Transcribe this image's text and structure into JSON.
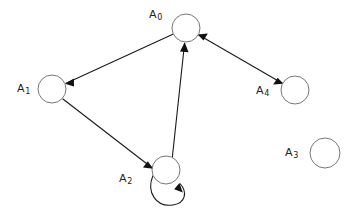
{
  "diagram": {
    "background_color": "#ffffff",
    "node_fill_color": "#ffffff",
    "node_stroke_color": "#777777",
    "edge_color": "#1a1a1a",
    "label_color": "#222222",
    "nodes": [
      {
        "id": "A0",
        "label_main": "A",
        "label_sub": "0",
        "cx": 186,
        "cy": 28,
        "r": 14,
        "label_x": 149,
        "label_y": 9
      },
      {
        "id": "A1",
        "label_main": "A",
        "label_sub": "1",
        "cx": 52,
        "cy": 89,
        "r": 14,
        "label_x": 17,
        "label_y": 83
      },
      {
        "id": "A2",
        "label_main": "A",
        "label_sub": "2",
        "cx": 166,
        "cy": 170,
        "r": 14,
        "label_x": 119,
        "label_y": 173
      },
      {
        "id": "A3",
        "label_main": "A",
        "label_sub": "3",
        "cx": 325,
        "cy": 153,
        "r": 15,
        "label_x": 285,
        "label_y": 147
      },
      {
        "id": "A4",
        "label_main": "A",
        "label_sub": "4",
        "cx": 295,
        "cy": 90,
        "r": 14,
        "label_x": 256,
        "label_y": 85
      }
    ],
    "edges": [
      {
        "id": "edge-a0-a1",
        "from": "A0",
        "to": "A1",
        "arrow_at_source": false,
        "arrow_at_target": true
      },
      {
        "id": "edge-a1-a2",
        "from": "A1",
        "to": "A2",
        "arrow_at_source": false,
        "arrow_at_target": true
      },
      {
        "id": "edge-a2-a0",
        "from": "A2",
        "to": "A0",
        "arrow_at_source": false,
        "arrow_at_target": true
      },
      {
        "id": "edge-a0-a4",
        "from": "A0",
        "to": "A4",
        "arrow_at_source": true,
        "arrow_at_target": true
      }
    ],
    "self_loops": [
      {
        "id": "loop-a2",
        "node": "A2",
        "arrow_at_target": true
      }
    ]
  }
}
